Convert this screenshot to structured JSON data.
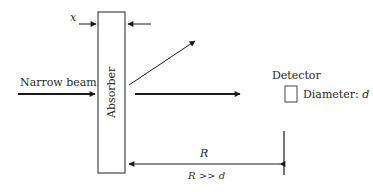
{
  "diagram": {
    "labels": {
      "thickness_symbol": "x",
      "incident_beam": "Narrow beam",
      "absorber": "Absorber",
      "detector": "Detector",
      "detector_diameter_prefix": "Diameter: ",
      "detector_diameter_symbol": "d",
      "distance_symbol": "R",
      "distance_condition": "R >> d"
    },
    "colors": {
      "stroke": "#2a2a2a",
      "fill": "#ffffff"
    }
  }
}
